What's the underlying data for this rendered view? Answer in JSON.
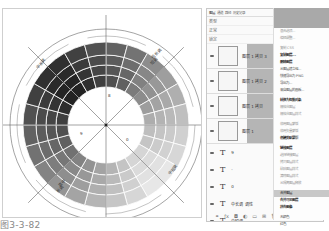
{
  "figure": {
    "caption": "图3-3-82",
    "wheel_labels": {
      "top_right": "低长调",
      "top_right_2": "短调",
      "left_top": "中长调",
      "bottom_left": "高中",
      "bottom_left_2": "长调",
      "right_bottom": "中短调",
      "marker_inner_top": "8",
      "marker_inner_left": "9",
      "marker_inner_right": "0"
    },
    "colors": {
      "darkest": "#2e2e2e",
      "dark": "#4a4a4a",
      "mid": "#8c8c8c",
      "light": "#c8c8c8",
      "lightest": "#ececec",
      "lines": "#555555"
    }
  },
  "layers_panel": {
    "tabs": [
      "图层",
      "通道",
      "路径",
      "历史记录",
      "动作"
    ],
    "kind_label": "类型",
    "blend_mode": "正常",
    "opacity_label": "不透明度",
    "opacity": "100%",
    "lock_label": "锁定",
    "fill_label": "填充",
    "fill": "100%",
    "image_layers": [
      {
        "name": "图层 1 拷贝 3"
      },
      {
        "name": "图层 1 拷贝 2"
      },
      {
        "name": "图层 1 拷贝"
      },
      {
        "name": "图层 1"
      }
    ],
    "text_layers": [
      {
        "name": "9"
      },
      {
        "name": "-"
      },
      {
        "name": "0"
      },
      {
        "name": "中长调 调性"
      },
      {
        "name": "中短调"
      },
      {
        "name": "长调"
      }
    ],
    "bottom_icons": [
      "link-icon",
      "fx-icon",
      "mask-icon",
      "adjustment-icon",
      "group-icon",
      "new-layer-icon",
      "trash-icon"
    ]
  },
  "context_menu": {
    "items": [
      {
        "label": "混合选项...",
        "style": "dim"
      },
      {
        "label": "编辑调整...",
        "style": "dim"
      },
      {
        "label": "复制 CSS",
        "style": "dim",
        "gap": true
      },
      {
        "label": "复制图层...",
        "style": "bold"
      },
      {
        "label": "删除图层",
        "style": "bold"
      },
      {
        "label": "从图层建立组...",
        "style": "normal"
      },
      {
        "label": "快速导出为 PNG",
        "style": "normal"
      },
      {
        "label": "导出为...",
        "style": "normal"
      },
      {
        "label": "来自图层的画板...",
        "style": "normal"
      },
      {
        "label": "转换为智能对象",
        "style": "bold",
        "gap": true
      },
      {
        "label": "栅格化图层",
        "style": "dim"
      },
      {
        "label": "栅格化图层样式",
        "style": "dim"
      },
      {
        "label": "停用图层蒙版",
        "style": "dim",
        "gap": true
      },
      {
        "label": "停用矢量蒙版",
        "style": "dim"
      },
      {
        "label": "创建剪贴蒙版",
        "style": "bold"
      },
      {
        "label": "链接图层",
        "style": "bold",
        "gap": true
      },
      {
        "label": "选择链接图层",
        "style": "dim"
      },
      {
        "label": "拷贝图层样式",
        "style": "dim"
      },
      {
        "label": "粘贴图层样式",
        "style": "dim"
      },
      {
        "label": "清除图层样式",
        "style": "dim"
      },
      {
        "label": "从隔离图层释放",
        "style": "dim"
      },
      {
        "label": "合并图层",
        "style": "hl",
        "gap": true
      },
      {
        "label": "合并可见图层",
        "style": "bold"
      },
      {
        "label": "拼合图像",
        "style": "bold"
      },
      {
        "label": "无颜色",
        "style": "normal",
        "gap": true
      },
      {
        "label": "红色",
        "style": "normal"
      }
    ]
  }
}
